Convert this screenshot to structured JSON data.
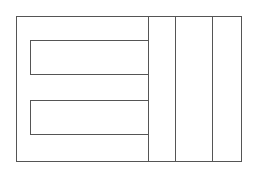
{
  "diagram": {
    "stroke_color": "#555555",
    "background": "#ffffff",
    "outer_frame": {
      "x": 16,
      "y": 16,
      "w": 226,
      "h": 146
    },
    "inner_boxes": [
      {
        "x": 30,
        "y": 40,
        "w": 119,
        "h": 35
      },
      {
        "x": 30,
        "y": 100,
        "w": 119,
        "h": 35
      }
    ],
    "vertical_dividers": [
      {
        "x": 148,
        "y": 16,
        "h": 146
      },
      {
        "x": 175,
        "y": 16,
        "h": 146
      },
      {
        "x": 212,
        "y": 16,
        "h": 146
      }
    ]
  }
}
